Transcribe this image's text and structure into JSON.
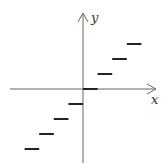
{
  "chart_data": {
    "type": "line",
    "title": "",
    "xlabel": "x",
    "ylabel": "y",
    "grid": false,
    "legend": null,
    "xlim": [
      -4,
      4
    ],
    "ylim": [
      -4,
      4
    ],
    "segments": [
      {
        "x0": -4,
        "x1": -3,
        "y": -4
      },
      {
        "x0": -3,
        "x1": -2,
        "y": -3
      },
      {
        "x0": -2,
        "x1": -1,
        "y": -2
      },
      {
        "x0": -1,
        "x1": 0,
        "y": -1
      },
      {
        "x0": 0,
        "x1": 1,
        "y": 0
      },
      {
        "x0": 1,
        "x1": 2,
        "y": 1
      },
      {
        "x0": 2,
        "x1": 3,
        "y": 2
      },
      {
        "x0": 3,
        "x1": 4,
        "y": 3
      }
    ],
    "colors": {
      "axis": "#555555",
      "segment": "#222222"
    }
  },
  "axes": {
    "x_label": "x",
    "y_label": "y"
  }
}
